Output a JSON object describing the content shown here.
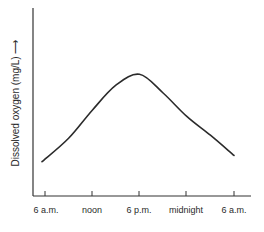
{
  "chart_data": {
    "type": "line",
    "title": "",
    "xlabel": "",
    "ylabel": "Dissolved oxygen (mg/L)",
    "ylabel_arrow": "→",
    "categories": [
      "6 a.m.",
      "noon",
      "6 p.m.",
      "midnight",
      "6 a.m."
    ],
    "x_hours": [
      6,
      9,
      12,
      15,
      18,
      21,
      24,
      27,
      30
    ],
    "series": [
      {
        "name": "Dissolved oxygen",
        "values_relative": [
          0.22,
          0.37,
          0.55,
          0.71,
          0.78,
          0.66,
          0.51,
          0.39,
          0.26
        ]
      }
    ],
    "y_ticks": [],
    "ylim": [
      0,
      1
    ],
    "grid": false,
    "legend": null,
    "annotation": "Diurnal variation: minimum near dawn, peak near late afternoon (~5-6 p.m.)"
  },
  "axis": {
    "x_ticks": [
      {
        "label": "6 a.m."
      },
      {
        "label": "noon"
      },
      {
        "label": "6 p.m."
      },
      {
        "label": "midnight"
      },
      {
        "label": "6 a.m."
      }
    ]
  }
}
